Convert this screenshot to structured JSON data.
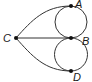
{
  "diagram": {
    "type": "graph",
    "nodes": [
      {
        "id": "A",
        "label": "A",
        "x": 71,
        "y": 6
      },
      {
        "id": "B",
        "label": "B",
        "x": 71,
        "y": 38
      },
      {
        "id": "C",
        "label": "C",
        "x": 16,
        "y": 38
      },
      {
        "id": "D",
        "label": "D",
        "x": 71,
        "y": 71
      }
    ],
    "edges": [
      {
        "from": "C",
        "to": "A",
        "shape": "curve"
      },
      {
        "from": "C",
        "to": "B",
        "shape": "line"
      },
      {
        "from": "C",
        "to": "D",
        "shape": "curve"
      },
      {
        "from": "A",
        "to": "B",
        "shape": "arc-left"
      },
      {
        "from": "A",
        "to": "B",
        "shape": "arc-right"
      },
      {
        "from": "B",
        "to": "D",
        "shape": "arc-left"
      },
      {
        "from": "B",
        "to": "D",
        "shape": "arc-right"
      }
    ],
    "colors": {
      "stroke": "#333333",
      "node": "#111111"
    }
  }
}
